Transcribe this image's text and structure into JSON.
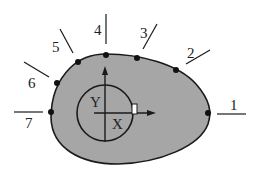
{
  "diagram": {
    "type": "cross-section with measurement points",
    "colors": {
      "fill": "#a6a6a6",
      "stroke": "#1a1a1a",
      "background": "#ffffff"
    },
    "points": [
      {
        "id": "1",
        "label": "1"
      },
      {
        "id": "2",
        "label": "2"
      },
      {
        "id": "3",
        "label": "3"
      },
      {
        "id": "4",
        "label": "4"
      },
      {
        "id": "5",
        "label": "5"
      },
      {
        "id": "6",
        "label": "6"
      },
      {
        "id": "7",
        "label": "7"
      }
    ],
    "axes": {
      "x_label": "X",
      "y_label": "Y"
    }
  }
}
